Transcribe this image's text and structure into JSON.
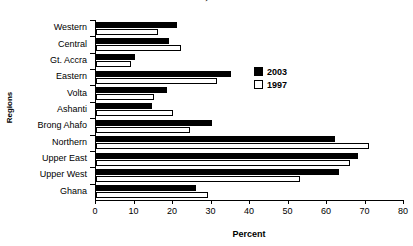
{
  "chart_data": {
    "type": "bar",
    "orientation": "horizontal",
    "title": "in 1997, 2003",
    "xlabel": "Percent",
    "ylabel": "Regions",
    "xlim": [
      0,
      80
    ],
    "xticks": [
      0,
      10,
      20,
      30,
      40,
      50,
      60,
      70,
      80
    ],
    "grid": false,
    "legend_position": "inside-upper-right",
    "categories": [
      "Western",
      "Central",
      "Gt. Accra",
      "Eastern",
      "Volta",
      "Ashanti",
      "Brong Ahafo",
      "Northern",
      "Upper East",
      "Upper West",
      "Ghana"
    ],
    "series": [
      {
        "name": "2003",
        "color": "#000000",
        "values": [
          21,
          19,
          10,
          35,
          18.5,
          14.5,
          30,
          62,
          68,
          63,
          26
        ]
      },
      {
        "name": "1997",
        "color": "#ffffff",
        "values": [
          16,
          22,
          9,
          31.5,
          15,
          20,
          24.5,
          71,
          66,
          53,
          29
        ]
      }
    ]
  }
}
